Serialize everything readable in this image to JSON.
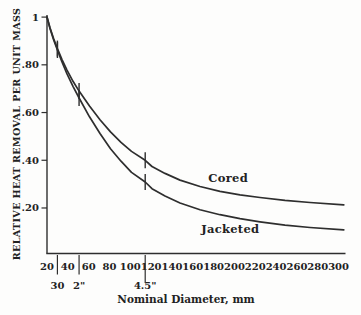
{
  "chart_data": {
    "type": "line",
    "title": "",
    "xlabel": "Nominal Diameter, mm",
    "ylabel": "RELATIVE HEAT REMOVAL PER UNIT MASS",
    "xlim": [
      20,
      305
    ],
    "ylim": [
      0,
      1.0
    ],
    "grid": false,
    "legend": "inline-labels",
    "ink_color": "#2e2e2e",
    "background": "#fdfdfc",
    "y_ticks": [
      1.0,
      0.8,
      0.6,
      0.4,
      0.2
    ],
    "y_tick_labels": [
      "1",
      ".80",
      ".60",
      ".40",
      ".20"
    ],
    "x_ticks": [
      20,
      40,
      60,
      80,
      100,
      120,
      140,
      160,
      180,
      200,
      220,
      240,
      260,
      280,
      300
    ],
    "x_tick_labels": [
      "20",
      "40",
      "60",
      "80",
      "100",
      "120",
      "140",
      "160",
      "180",
      "200",
      "220",
      "240",
      "260",
      "280",
      "300"
    ],
    "secondary_x_marks": [
      {
        "label": "30",
        "mm": 30,
        "long": false
      },
      {
        "label": "2\"",
        "mm": 50.8,
        "long": false
      },
      {
        "label": "4.5\"",
        "mm": 114.3,
        "long": true
      }
    ],
    "curve_markers_mm": [
      30,
      50.8,
      114.3
    ],
    "series": [
      {
        "name": "Cored",
        "label": "Cored",
        "label_at": {
          "mm": 194,
          "value": 0.327
        },
        "x": [
          20,
          22.9,
          26.2,
          30,
          34.4,
          39.2,
          45,
          50.8,
          60.8,
          70.9,
          81,
          91.1,
          101.1,
          114.3,
          120.8,
          133.3,
          147.7,
          166.9,
          186.1,
          205.3,
          224.5,
          248.5,
          272.5,
          305
        ],
        "values": [
          1.0,
          0.955,
          0.911,
          0.868,
          0.822,
          0.778,
          0.731,
          0.69,
          0.627,
          0.57,
          0.519,
          0.475,
          0.437,
          0.4,
          0.374,
          0.345,
          0.317,
          0.29,
          0.27,
          0.255,
          0.244,
          0.232,
          0.223,
          0.213
        ]
      },
      {
        "name": "Jacketed",
        "label": "Jacketed",
        "label_at": {
          "mm": 196,
          "value": 0.112
        },
        "x": [
          20,
          22.9,
          26.2,
          30,
          34.4,
          39.2,
          45,
          50.8,
          60.8,
          70.9,
          81,
          91.1,
          101.1,
          114.3,
          120.8,
          133.3,
          147.7,
          166.9,
          186.1,
          205.3,
          224.5,
          248.5,
          272.5,
          305
        ],
        "values": [
          1.0,
          0.952,
          0.906,
          0.862,
          0.812,
          0.762,
          0.71,
          0.661,
          0.582,
          0.512,
          0.448,
          0.396,
          0.349,
          0.309,
          0.281,
          0.25,
          0.221,
          0.193,
          0.172,
          0.155,
          0.142,
          0.128,
          0.118,
          0.108
        ]
      }
    ]
  }
}
